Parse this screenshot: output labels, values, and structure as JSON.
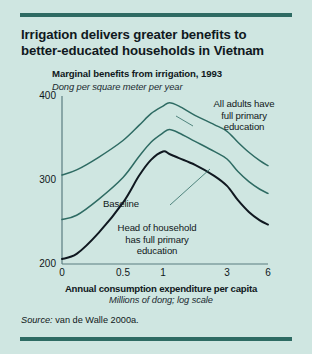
{
  "figure": {
    "title": "Irrigation delivers greater benefits to better-educated households in Vietnam",
    "source_label": "Source:",
    "source_text": " van de Walle 2000a.",
    "background_color": "#cfe6e1",
    "rule_color": "#2e6b63"
  },
  "chart_data": {
    "type": "line",
    "title": "Marginal benefits from irrigation, 1993",
    "subtitle": "Dong per square meter per year",
    "xlabel": "Annual consumption expenditure per capita",
    "xlabel_sub": "Millions of dong; log scale",
    "ylabel": "",
    "grid": false,
    "legend_position": "annotations",
    "x_scale": "log",
    "x_ticks": [
      "0",
      "0.5",
      "1",
      "3",
      "6"
    ],
    "x_tick_values": [
      0,
      0.5,
      1,
      3,
      6
    ],
    "y_ticks": [
      "200",
      "300",
      "400"
    ],
    "y_tick_values": [
      200,
      300,
      400
    ],
    "ylim": [
      200,
      400
    ],
    "x_axis_positions_px": [
      62,
      123,
      163,
      227,
      268
    ],
    "series": [
      {
        "name": "All adults have full primary education",
        "color": "#2e6b63",
        "line_width": 1.5,
        "x": [
          0,
          0.12,
          0.3,
          0.5,
          0.7,
          0.85,
          1.0,
          1.2,
          1.5,
          2.0,
          2.6,
          3.0,
          3.8,
          4.6,
          5.4,
          6.0
        ],
        "values": [
          306,
          312,
          327,
          347,
          365,
          379,
          388,
          392,
          388,
          377,
          366,
          358,
          345,
          333,
          323,
          317
        ]
      },
      {
        "name": "Head of household has full primary education",
        "color": "#2e6b63",
        "line_width": 1.5,
        "x": [
          0,
          0.12,
          0.3,
          0.5,
          0.7,
          0.85,
          1.0,
          1.2,
          1.5,
          2.0,
          2.6,
          3.0,
          3.8,
          4.6,
          5.4,
          6.0
        ],
        "values": [
          253,
          258,
          277,
          303,
          328,
          345,
          356,
          360,
          356,
          346,
          334,
          325,
          310,
          298,
          289,
          284
        ]
      },
      {
        "name": "Baseline",
        "color": "#101820",
        "line_width": 2,
        "x": [
          0,
          0.12,
          0.3,
          0.5,
          0.7,
          0.85,
          1.0,
          1.2,
          1.5,
          2.0,
          2.6,
          3.0,
          3.8,
          4.6,
          5.4,
          6.0
        ],
        "values": [
          206,
          212,
          237,
          273,
          305,
          324,
          334,
          331,
          326,
          318,
          305,
          293,
          276,
          262,
          252,
          247
        ]
      }
    ],
    "annotations": [
      {
        "name": "all-adults",
        "lines": [
          "All adults have",
          "full primary",
          "education"
        ],
        "text": "All adults have full primary education"
      },
      {
        "name": "baseline",
        "lines": [
          "Baseline"
        ],
        "text": "Baseline"
      },
      {
        "name": "head-of-household",
        "lines": [
          "Head of household",
          "has full primary",
          "education"
        ],
        "text": "Head of household has full primary education"
      }
    ]
  },
  "annotations_text": {
    "all_adults_l1": "All adults have",
    "all_adults_l2": "full primary",
    "all_adults_l3": "education",
    "baseline": "Baseline",
    "head_l1": "Head of household",
    "head_l2": "has full primary",
    "head_l3": "education"
  }
}
